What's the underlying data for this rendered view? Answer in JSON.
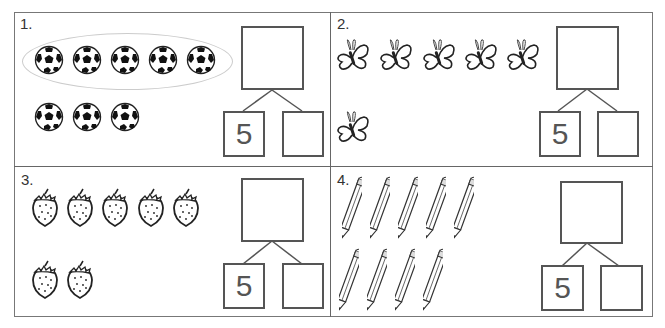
{
  "worksheet": {
    "problems": [
      {
        "label": "1.",
        "object": "soccer-ball",
        "count": 8,
        "rows": [
          5,
          3
        ],
        "circled_group": 5,
        "number_bond": {
          "whole": "",
          "part_left": "5",
          "part_right": ""
        }
      },
      {
        "label": "2.",
        "object": "butterfly",
        "count": 6,
        "rows": [
          5,
          1
        ],
        "number_bond": {
          "whole": "",
          "part_left": "5",
          "part_right": ""
        }
      },
      {
        "label": "3.",
        "object": "strawberry",
        "count": 7,
        "rows": [
          5,
          2
        ],
        "number_bond": {
          "whole": "",
          "part_left": "5",
          "part_right": ""
        }
      },
      {
        "label": "4.",
        "object": "pencil",
        "count": 9,
        "rows": [
          5,
          4
        ],
        "number_bond": {
          "whole": "",
          "part_left": "5",
          "part_right": ""
        }
      }
    ]
  },
  "colors": {
    "line": "#555555",
    "border": "#777777",
    "text": "#333333"
  }
}
